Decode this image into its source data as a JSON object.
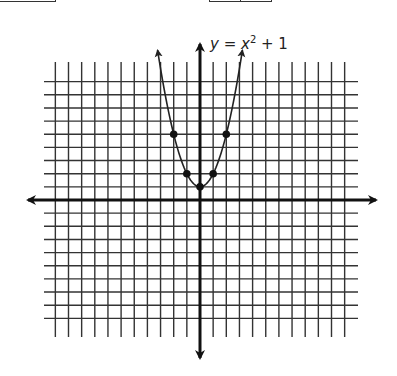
{
  "chart_data": {
    "type": "line",
    "equation": {
      "lhs": "y",
      "eq": " = ",
      "var": "x",
      "exp": "2",
      "rest": " + 1"
    },
    "xlabel": "",
    "ylabel": "",
    "grid": true,
    "xlim": [
      -11,
      11
    ],
    "ylim": [
      -9,
      9
    ],
    "axis_ticks_labeled": false,
    "series": [
      {
        "name": "y = x² + 1",
        "x": [
          -2,
          -1,
          0,
          1,
          2
        ],
        "y": [
          5,
          2,
          1,
          2,
          5
        ],
        "marked_points": true,
        "curve": "parabola, arrows at both ends"
      }
    ],
    "style": {
      "line_color": "#222222",
      "grid_color": "#333333",
      "axis_color": "#111111"
    }
  }
}
